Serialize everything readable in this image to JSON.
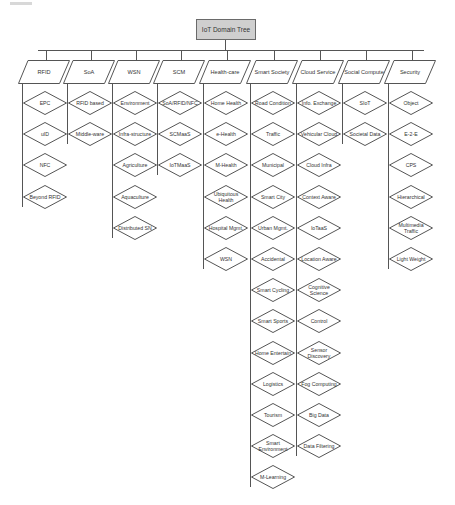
{
  "root": {
    "label": "IoT Domain Tree"
  },
  "colors": {
    "root_fill": "#cfcfcf",
    "stroke": "#555555",
    "text": "#333333",
    "background": "#ffffff"
  },
  "categories": [
    {
      "label": "RFID",
      "children": [
        "EPC",
        "uID",
        "NFC",
        "Beyond RFID"
      ]
    },
    {
      "label": "SoA",
      "children": [
        "RFID based",
        "Middle-ware"
      ]
    },
    {
      "label": "WSN",
      "children": [
        "Environment",
        "Infra-structure",
        "Agriculture",
        "Aquaculture",
        "Distributed SN"
      ]
    },
    {
      "label": "SCM",
      "children": [
        "SoA/RFID/NFC",
        "SCMaaS",
        "IoTMaaS"
      ]
    },
    {
      "label": "Health-care",
      "children": [
        "Home Health",
        "e-Health",
        "M-Health",
        "Ubiquitous Health",
        "Hospital Mgmt.",
        "WSN"
      ]
    },
    {
      "label": "Smart Society",
      "children": [
        "Road Condition",
        "Traffic",
        "Municipal",
        "Smart City",
        "Urban Mgmt.",
        "Accidental",
        "Smart Cycling",
        "Smart Sports",
        "Home Entertain",
        "Logistics",
        "Tourism",
        "Smart Environment",
        "M-Learning"
      ]
    },
    {
      "label": "Cloud Service",
      "children": [
        "Info. Exchange",
        "Vehicular Cloud",
        "Cloud Infra",
        "Context Aware",
        "IoTaaS",
        "Location Aware",
        "Cognitive Science",
        "Control",
        "Sensor Discovery",
        "Fog Computing",
        "Big Data",
        "Data Filtering"
      ]
    },
    {
      "label": "Social Compute",
      "children": [
        "SIoT",
        "Societal Data"
      ]
    },
    {
      "label": "Security",
      "children": [
        "Object",
        "E-2-E",
        "CPS",
        "Hierarchical",
        "Multimedia Traffic",
        "Light Weight"
      ]
    }
  ]
}
